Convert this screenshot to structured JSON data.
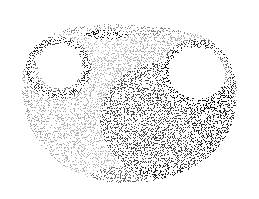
{
  "image": {
    "subject": "stippled two-handled vase",
    "style": "stipple dot shading, black ink on white",
    "width": 259,
    "height": 199,
    "colors": {
      "background": "#ffffff",
      "ink": "#000000"
    },
    "shapes": {
      "body": {
        "cx": 129,
        "cy": 103,
        "rx": 112,
        "ry": 78
      },
      "left_handle_hole": {
        "cx": 60,
        "cy": 66,
        "rx": 22,
        "ry": 22
      },
      "right_handle_hole": {
        "cx": 197,
        "cy": 73,
        "rx": 28,
        "ry": 25
      },
      "neck_shadow": {
        "cx": 106,
        "cy": 35,
        "rx": 22,
        "ry": 5
      }
    }
  }
}
